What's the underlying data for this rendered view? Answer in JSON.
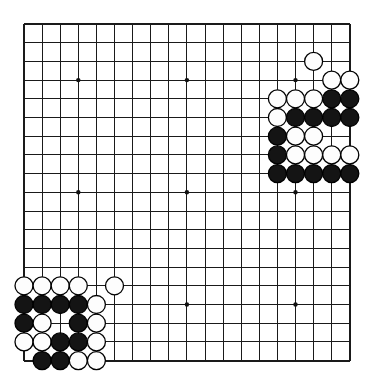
{
  "diagram": {
    "board": {
      "size": 19,
      "origin_x": 24,
      "origin_y": 24,
      "step_x": 18.1,
      "step_y": 18.7,
      "stone_radius": 9.0,
      "line_color": "#1a1a1a",
      "background_color": "#ffffff",
      "black_color": "#141414",
      "white_color": "#fdfdfd"
    },
    "star_points": [
      {
        "col": 3,
        "row": 3
      },
      {
        "col": 9,
        "row": 3
      },
      {
        "col": 15,
        "row": 3
      },
      {
        "col": 3,
        "row": 9
      },
      {
        "col": 9,
        "row": 9
      },
      {
        "col": 15,
        "row": 9
      },
      {
        "col": 3,
        "row": 15
      },
      {
        "col": 9,
        "row": 15
      },
      {
        "col": 15,
        "row": 15
      }
    ],
    "stones": [
      {
        "col": 16,
        "row": 2,
        "color": "white"
      },
      {
        "col": 17,
        "row": 3,
        "color": "white"
      },
      {
        "col": 18,
        "row": 3,
        "color": "white"
      },
      {
        "col": 14,
        "row": 4,
        "color": "white"
      },
      {
        "col": 15,
        "row": 4,
        "color": "white"
      },
      {
        "col": 16,
        "row": 4,
        "color": "white"
      },
      {
        "col": 17,
        "row": 4,
        "color": "black"
      },
      {
        "col": 18,
        "row": 4,
        "color": "black"
      },
      {
        "col": 14,
        "row": 5,
        "color": "white"
      },
      {
        "col": 15,
        "row": 5,
        "color": "black"
      },
      {
        "col": 16,
        "row": 5,
        "color": "black"
      },
      {
        "col": 17,
        "row": 5,
        "color": "black"
      },
      {
        "col": 18,
        "row": 5,
        "color": "black"
      },
      {
        "col": 14,
        "row": 6,
        "color": "black"
      },
      {
        "col": 15,
        "row": 6,
        "color": "white"
      },
      {
        "col": 16,
        "row": 6,
        "color": "white"
      },
      {
        "col": 14,
        "row": 7,
        "color": "black"
      },
      {
        "col": 15,
        "row": 7,
        "color": "white"
      },
      {
        "col": 16,
        "row": 7,
        "color": "white"
      },
      {
        "col": 17,
        "row": 7,
        "color": "white"
      },
      {
        "col": 18,
        "row": 7,
        "color": "white"
      },
      {
        "col": 14,
        "row": 8,
        "color": "black"
      },
      {
        "col": 15,
        "row": 8,
        "color": "black"
      },
      {
        "col": 16,
        "row": 8,
        "color": "black"
      },
      {
        "col": 17,
        "row": 8,
        "color": "black"
      },
      {
        "col": 18,
        "row": 8,
        "color": "black"
      },
      {
        "col": 0,
        "row": 14,
        "color": "white"
      },
      {
        "col": 1,
        "row": 14,
        "color": "white"
      },
      {
        "col": 2,
        "row": 14,
        "color": "white"
      },
      {
        "col": 3,
        "row": 14,
        "color": "white"
      },
      {
        "col": 5,
        "row": 14,
        "color": "white"
      },
      {
        "col": 0,
        "row": 15,
        "color": "black"
      },
      {
        "col": 1,
        "row": 15,
        "color": "black"
      },
      {
        "col": 2,
        "row": 15,
        "color": "black"
      },
      {
        "col": 3,
        "row": 15,
        "color": "black"
      },
      {
        "col": 4,
        "row": 15,
        "color": "white"
      },
      {
        "col": 0,
        "row": 16,
        "color": "black"
      },
      {
        "col": 1,
        "row": 16,
        "color": "white"
      },
      {
        "col": 3,
        "row": 16,
        "color": "black"
      },
      {
        "col": 4,
        "row": 16,
        "color": "white"
      },
      {
        "col": 0,
        "row": 17,
        "color": "white"
      },
      {
        "col": 1,
        "row": 17,
        "color": "white"
      },
      {
        "col": 2,
        "row": 17,
        "color": "black"
      },
      {
        "col": 3,
        "row": 17,
        "color": "black"
      },
      {
        "col": 4,
        "row": 17,
        "color": "white"
      },
      {
        "col": 1,
        "row": 18,
        "color": "black"
      },
      {
        "col": 2,
        "row": 18,
        "color": "black"
      },
      {
        "col": 3,
        "row": 18,
        "color": "white"
      },
      {
        "col": 4,
        "row": 18,
        "color": "white"
      }
    ]
  }
}
